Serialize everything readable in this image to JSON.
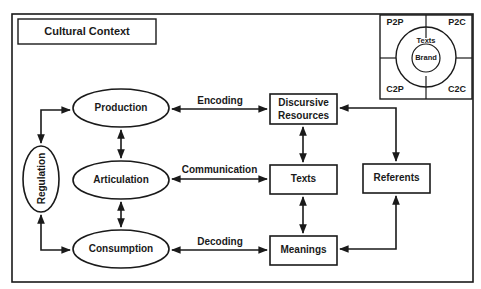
{
  "title": "Cultural Context",
  "nodes": {
    "production": "Production",
    "articulation": "Articulation",
    "consumption": "Consumption",
    "regulation": "Regulation",
    "discursive_resources": "Discursive\nResources",
    "discursive_line1": "Discursive",
    "discursive_line2": "Resources",
    "texts": "Texts",
    "meanings": "Meanings",
    "referents": "Referents"
  },
  "edges": {
    "encoding": "Encoding",
    "communication": "Communication",
    "decoding": "Decoding"
  },
  "inset": {
    "quadrants": [
      "P2P",
      "P2C",
      "C2P",
      "C2C"
    ],
    "outer_ring": "Texts",
    "inner_circle": "Brand"
  },
  "colors": {
    "stroke": "#1a1a1a",
    "background": "#ffffff"
  }
}
